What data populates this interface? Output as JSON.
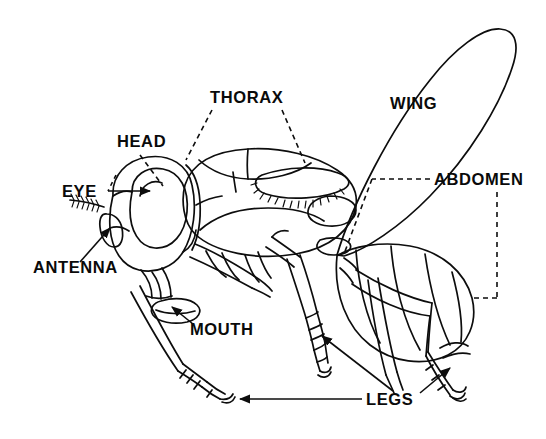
{
  "figure": {
    "kind": "anatomical-line-diagram",
    "background_color": "#ffffff",
    "ink_color": "#0d0d0d",
    "width": 546,
    "height": 439
  },
  "labels": [
    {
      "id": "head",
      "text": "HEAD",
      "x": 117,
      "y": 147,
      "leader": "dashed"
    },
    {
      "id": "thorax",
      "text": "THORAX",
      "x": 210,
      "y": 103,
      "leader": "dashed"
    },
    {
      "id": "wing",
      "text": "WING",
      "x": 390,
      "y": 109,
      "leader": "none"
    },
    {
      "id": "abdomen",
      "text": "ABDOMEN",
      "x": 434,
      "y": 185,
      "leader": "dashed-bracket"
    },
    {
      "id": "eye",
      "text": "EYE",
      "x": 62,
      "y": 197,
      "leader": "arrow"
    },
    {
      "id": "antenna",
      "text": "ANTENNA",
      "x": 33,
      "y": 273,
      "leader": "arrow"
    },
    {
      "id": "mouth",
      "text": "MOUTH",
      "x": 190,
      "y": 335,
      "leader": "arrow"
    },
    {
      "id": "legs",
      "text": "LEGS",
      "x": 366,
      "y": 405,
      "leader": "arrow"
    }
  ]
}
